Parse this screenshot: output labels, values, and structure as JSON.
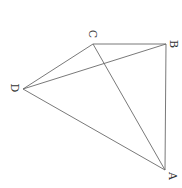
{
  "diagram": {
    "type": "geometry",
    "points": [
      {
        "id": "A",
        "label": "A",
        "x": 165,
        "y": 170,
        "lx": 172,
        "ly": 176
      },
      {
        "id": "B",
        "label": "B",
        "x": 166,
        "y": 44,
        "lx": 173,
        "ly": 44
      },
      {
        "id": "C",
        "label": "C",
        "x": 93,
        "y": 44,
        "lx": 92,
        "ly": 34
      },
      {
        "id": "D",
        "label": "D",
        "x": 23,
        "y": 89,
        "lx": 14,
        "ly": 88
      }
    ],
    "segments": [
      [
        "A",
        "B"
      ],
      [
        "B",
        "C"
      ],
      [
        "C",
        "D"
      ],
      [
        "D",
        "A"
      ],
      [
        "A",
        "C"
      ],
      [
        "D",
        "B"
      ]
    ],
    "label_rotation_deg": 90,
    "colors": {
      "line": "#6a6a6a",
      "text": "#333333",
      "background": "#ffffff"
    }
  }
}
